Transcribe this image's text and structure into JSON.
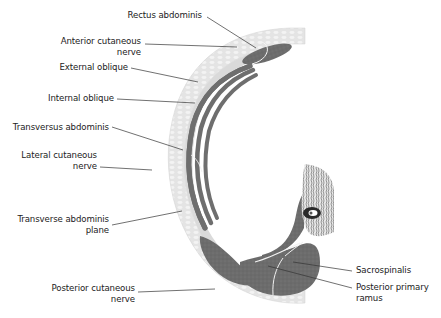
{
  "diagram": {
    "type": "anatomical cross-section",
    "colors": {
      "skin": "#e6e6e6",
      "subcutaneous": "#d8d8d8",
      "muscle": "#6e6e6e",
      "fascia": "#f2f2f2",
      "bone": "#cfcfcf",
      "line": "#333333"
    },
    "labels": [
      {
        "id": "rectus-abdominis",
        "lines": [
          "Rectus abdominis"
        ]
      },
      {
        "id": "anterior-cutaneous-nerve",
        "lines": [
          "Anterior cutaneous",
          "nerve"
        ]
      },
      {
        "id": "external-oblique",
        "lines": [
          "External oblique"
        ]
      },
      {
        "id": "internal-oblique",
        "lines": [
          "Internal oblique"
        ]
      },
      {
        "id": "transversus-abdominis",
        "lines": [
          "Transversus abdominis"
        ]
      },
      {
        "id": "lateral-cutaneous-nerve",
        "lines": [
          "Lateral cutaneous",
          "nerve"
        ]
      },
      {
        "id": "transverse-abdominis-plane",
        "lines": [
          "Transverse abdominis",
          "plane"
        ]
      },
      {
        "id": "posterior-cutaneous-nerve",
        "lines": [
          "Posterior cutaneous",
          "nerve"
        ]
      },
      {
        "id": "sacrospinalis",
        "lines": [
          "Sacrospinalis"
        ]
      },
      {
        "id": "posterior-primary-ramus",
        "lines": [
          "Posterior primary",
          "ramus"
        ]
      }
    ]
  }
}
